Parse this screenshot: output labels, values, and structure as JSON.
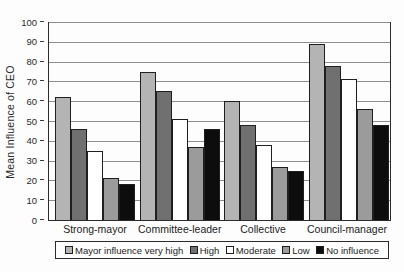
{
  "chart_data": {
    "type": "bar",
    "title": "",
    "ylabel": "Mean Influence of CEO",
    "xlabel": "",
    "ylim": [
      0,
      100
    ],
    "ytick_step": 10,
    "grid": true,
    "legend_position": "bottom",
    "categories": [
      "Strong-mayor",
      "Committee-leader",
      "Collective",
      "Council-manager"
    ],
    "series": [
      {
        "name": "Mayor influence very high",
        "color": "#b4b4b4",
        "values": [
          62,
          75,
          60,
          89
        ]
      },
      {
        "name": "High",
        "color": "#707070",
        "values": [
          46,
          65,
          48,
          78
        ]
      },
      {
        "name": "Moderate",
        "color": "#ffffff",
        "values": [
          35,
          51,
          38,
          71
        ]
      },
      {
        "name": "Low",
        "color": "#9b9b9b",
        "values": [
          21,
          37,
          27,
          56
        ]
      },
      {
        "name": "No influence",
        "color": "#0d0d0d",
        "values": [
          18,
          46,
          25,
          48
        ]
      }
    ]
  }
}
